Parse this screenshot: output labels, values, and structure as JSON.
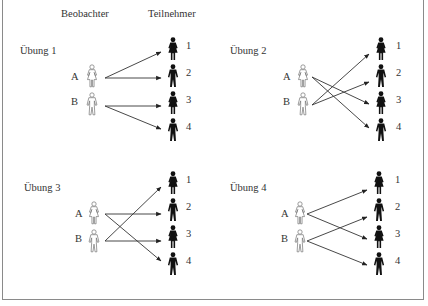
{
  "headers": {
    "observers": "Beobachter",
    "participants": "Teilnehmer"
  },
  "observers": [
    {
      "id": "A",
      "label": "A",
      "gender": "female",
      "icon": "woman-outline-icon"
    },
    {
      "id": "B",
      "label": "B",
      "gender": "male",
      "icon": "man-outline-icon"
    }
  ],
  "participants": [
    {
      "id": "1",
      "label": "1",
      "gender": "female",
      "icon": "woman-filled-icon"
    },
    {
      "id": "2",
      "label": "2",
      "gender": "male",
      "icon": "man-filled-icon"
    },
    {
      "id": "3",
      "label": "3",
      "gender": "female",
      "icon": "woman-filled-icon"
    },
    {
      "id": "4",
      "label": "4",
      "gender": "male",
      "icon": "man-filled-icon"
    }
  ],
  "exercises": [
    {
      "title": "Übung 1",
      "assignments": [
        [
          "A",
          "1"
        ],
        [
          "A",
          "2"
        ],
        [
          "B",
          "3"
        ],
        [
          "B",
          "4"
        ]
      ]
    },
    {
      "title": "Übung 2",
      "assignments": [
        [
          "A",
          "3"
        ],
        [
          "A",
          "4"
        ],
        [
          "B",
          "1"
        ],
        [
          "B",
          "2"
        ]
      ]
    },
    {
      "title": "Übung 3",
      "assignments": [
        [
          "A",
          "2"
        ],
        [
          "A",
          "4"
        ],
        [
          "B",
          "1"
        ],
        [
          "B",
          "3"
        ]
      ]
    },
    {
      "title": "Übung 4",
      "assignments": [
        [
          "A",
          "1"
        ],
        [
          "A",
          "3"
        ],
        [
          "B",
          "2"
        ],
        [
          "B",
          "4"
        ]
      ]
    }
  ],
  "colors": {
    "frame": "#8a8a8a",
    "arrow": "#333333",
    "participant_fill": "#111111",
    "observer_stroke": "#777777"
  }
}
